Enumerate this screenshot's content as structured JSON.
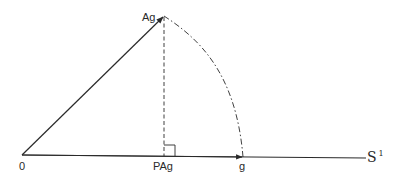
{
  "diagram": {
    "type": "geometric-projection",
    "labels": {
      "origin": "0",
      "ag": "Ag",
      "pag": "PAg",
      "g": "g",
      "space": "S",
      "space_sup": "1"
    },
    "points": {
      "origin": [
        22,
        155
      ],
      "ag": [
        164,
        16
      ],
      "pag": [
        164,
        156
      ],
      "g": [
        243,
        157
      ],
      "line_end": [
        366,
        158
      ]
    },
    "colors": {
      "stroke": "#2a2a2a",
      "background": "#ffffff"
    }
  }
}
